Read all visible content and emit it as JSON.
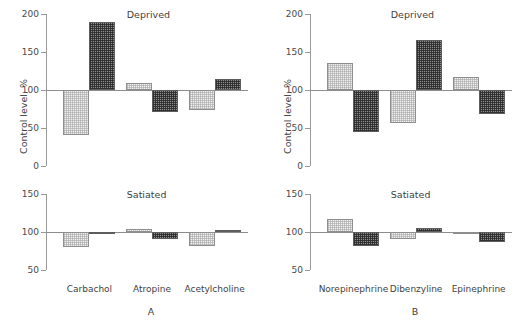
{
  "figure": {
    "panels": [
      {
        "letter": "A",
        "categories": [
          "Carbachol",
          "Atropine",
          "Acetylcholine"
        ],
        "charts": [
          {
            "title": "Deprived",
            "ylabel": "Control level, %",
            "yticks": [
              "0",
              "50",
              "100",
              "150",
              "200"
            ]
          },
          {
            "title": "Satiated",
            "ylabel": "",
            "yticks": [
              "50",
              "100",
              "150"
            ]
          }
        ]
      },
      {
        "letter": "B",
        "categories": [
          "Norepinephrine",
          "Dibenzyline",
          "Epinephrine"
        ],
        "charts": [
          {
            "title": "Deprived",
            "ylabel": "Control level, %",
            "yticks": [
              "0",
              "50",
              "100",
              "150",
              "200"
            ]
          },
          {
            "title": "Satiated",
            "ylabel": "",
            "yticks": [
              "50",
              "100",
              "150"
            ]
          }
        ]
      }
    ]
  },
  "chart_data": [
    {
      "type": "bar",
      "title": "Deprived",
      "panel": "A",
      "xlabel": "",
      "ylabel": "Control level, %",
      "ylim": [
        0,
        200
      ],
      "yticks": [
        0,
        50,
        100,
        150,
        200
      ],
      "baseline": 100,
      "grid": false,
      "categories": [
        "Carbachol",
        "Atropine",
        "Acetylcholine"
      ],
      "series": [
        {
          "name": "light",
          "values": [
            41,
            109,
            74
          ]
        },
        {
          "name": "dark",
          "values": [
            189,
            71,
            115
          ]
        }
      ]
    },
    {
      "type": "bar",
      "title": "Satiated",
      "panel": "A",
      "xlabel": "",
      "ylabel": "",
      "ylim": [
        50,
        150
      ],
      "yticks": [
        50,
        100,
        150
      ],
      "baseline": 100,
      "grid": false,
      "categories": [
        "Carbachol",
        "Atropine",
        "Acetylcholine"
      ],
      "series": [
        {
          "name": "light",
          "values": [
            80,
            104,
            81
          ]
        },
        {
          "name": "dark",
          "values": [
            97,
            91,
            103
          ]
        }
      ]
    },
    {
      "type": "bar",
      "title": "Deprived",
      "panel": "B",
      "xlabel": "",
      "ylabel": "Control level, %",
      "ylim": [
        0,
        200
      ],
      "yticks": [
        0,
        50,
        100,
        150,
        200
      ],
      "baseline": 100,
      "grid": false,
      "categories": [
        "Norepinephrine",
        "Dibenzyline",
        "Epinephrine"
      ],
      "series": [
        {
          "name": "light",
          "values": [
            136,
            57,
            117
          ]
        },
        {
          "name": "dark",
          "values": [
            45,
            166,
            68
          ]
        }
      ]
    },
    {
      "type": "bar",
      "title": "Satiated",
      "panel": "B",
      "xlabel": "",
      "ylabel": "",
      "ylim": [
        50,
        150
      ],
      "yticks": [
        50,
        100,
        150
      ],
      "baseline": 100,
      "grid": false,
      "categories": [
        "Norepinephrine",
        "Dibenzyline",
        "Epinephrine"
      ],
      "series": [
        {
          "name": "light",
          "values": [
            117,
            91,
            98
          ]
        },
        {
          "name": "dark",
          "values": [
            82,
            105,
            87
          ]
        }
      ]
    }
  ]
}
